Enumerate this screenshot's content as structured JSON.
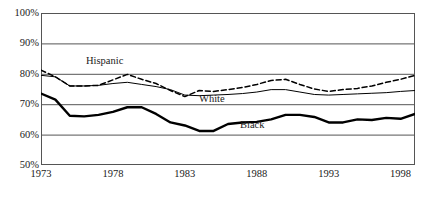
{
  "chart_data": {
    "type": "line",
    "title": "",
    "xlabel": "",
    "ylabel": "",
    "xlim": [
      1973,
      1999
    ],
    "ylim": [
      50,
      100
    ],
    "ytick_labels": [
      "100%",
      "90%",
      "80%",
      "70%",
      "60%",
      "50%"
    ],
    "ytick_values": [
      100,
      90,
      80,
      70,
      60,
      50
    ],
    "xtick_labels": [
      "1973",
      "1978",
      "1983",
      "1988",
      "1993",
      "1998"
    ],
    "xtick_values": [
      1973,
      1978,
      1983,
      1988,
      1993,
      1998
    ],
    "x_minor_tick_interval": 1,
    "grid": "horizontal",
    "legend_position": "inline-annotations",
    "x": [
      1973,
      1974,
      1975,
      1976,
      1977,
      1978,
      1979,
      1980,
      1981,
      1982,
      1983,
      1984,
      1985,
      1986,
      1987,
      1988,
      1989,
      1990,
      1991,
      1992,
      1993,
      1994,
      1995,
      1996,
      1997,
      1998,
      1999
    ],
    "series": [
      {
        "name": "Hispanic",
        "style": "dashed",
        "line_width": 1.5,
        "color": "#000000",
        "values": [
          81.2,
          79.0,
          76.0,
          76.0,
          76.2,
          78.0,
          79.8,
          78.2,
          76.8,
          74.5,
          72.5,
          74.5,
          74.2,
          74.8,
          75.5,
          76.5,
          77.8,
          78.2,
          76.5,
          75.0,
          74.2,
          74.8,
          75.2,
          76.0,
          77.2,
          78.2,
          79.5
        ]
      },
      {
        "name": "White",
        "style": "solid",
        "line_width": 1,
        "color": "#000000",
        "values": [
          79.5,
          79.0,
          76.0,
          76.0,
          76.2,
          76.8,
          77.2,
          76.5,
          75.8,
          74.8,
          73.0,
          72.8,
          73.0,
          73.2,
          73.5,
          74.0,
          74.8,
          74.8,
          74.0,
          73.2,
          73.0,
          73.2,
          73.4,
          73.6,
          73.8,
          74.2,
          74.5
        ]
      },
      {
        "name": "Black",
        "style": "solid",
        "line_width": 2.4,
        "color": "#000000",
        "values": [
          73.5,
          71.5,
          66.2,
          66.0,
          66.5,
          67.5,
          69.0,
          69.0,
          66.8,
          64.0,
          63.0,
          61.2,
          61.2,
          63.5,
          64.0,
          64.2,
          65.0,
          66.5,
          66.5,
          65.8,
          64.0,
          64.0,
          65.0,
          64.8,
          65.5,
          65.2,
          66.8
        ]
      }
    ],
    "annotations": [
      {
        "text": "Hispanic",
        "x_px": 86,
        "y_px": 55
      },
      {
        "text": "White",
        "x_px": 199,
        "y_px": 93
      },
      {
        "text": "Black",
        "x_px": 240,
        "y_px": 119
      }
    ]
  },
  "axes": {
    "y_labels": [
      "100%",
      "90%",
      "80%",
      "70%",
      "60%",
      "50%"
    ],
    "x_labels": [
      "1973",
      "1978",
      "1983",
      "1988",
      "1993",
      "1998"
    ]
  }
}
